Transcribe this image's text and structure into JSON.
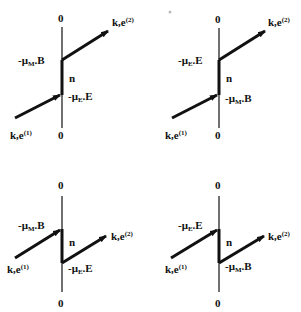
{
  "panels": [
    {
      "id": "top-left",
      "top_zero": "0",
      "bottom_zero": "0",
      "upper_label": "-μ",
      "upper_sub": "M",
      "upper_tail": ".B",
      "lower_label": "-μ",
      "lower_sub": "E",
      "lower_tail": ".E",
      "normal": "n",
      "in_label": "k,e",
      "in_sup": "(1)",
      "out_label": "k,e",
      "out_sup": "(2)"
    },
    {
      "id": "top-right",
      "top_zero": "0",
      "bottom_zero": "0",
      "upper_label": "-μ",
      "upper_sub": "E",
      "upper_tail": ".E",
      "lower_label": "-μ",
      "lower_sub": "M",
      "lower_tail": ".B",
      "normal": "n",
      "in_label": "k,e",
      "in_sup": "(1)",
      "out_label": "k,e",
      "out_sup": "(2)"
    },
    {
      "id": "bottom-left",
      "top_zero": "0",
      "bottom_zero": "0",
      "upper_label": "-μ",
      "upper_sub": "M",
      "upper_tail": ".B",
      "lower_label": "-μ",
      "lower_sub": "E",
      "lower_tail": ".E",
      "normal": "n",
      "in_label": "k,e",
      "in_sup": "(1)",
      "out_label": "k,e",
      "out_sup": "(2)"
    },
    {
      "id": "bottom-right",
      "top_zero": "0",
      "bottom_zero": "0",
      "upper_label": "-μ",
      "upper_sub": "E",
      "upper_tail": ".E",
      "lower_label": "-μ",
      "lower_sub": "M",
      "lower_tail": ".B",
      "normal": "n",
      "in_label": "k,e",
      "in_sup": "(1)",
      "out_label": "k,e",
      "out_sup": "(2)"
    }
  ],
  "colors": {
    "ink": "#111111",
    "background": "#ffffff"
  }
}
